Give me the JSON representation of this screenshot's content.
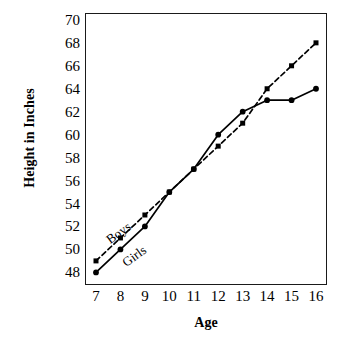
{
  "chart_data": {
    "type": "line",
    "title": "",
    "xlabel": "Age",
    "ylabel": "Height in Inches",
    "x": [
      7,
      8,
      9,
      10,
      11,
      12,
      13,
      14,
      15,
      16
    ],
    "xticklabels": [
      "7",
      "8",
      "9",
      "10",
      "11",
      "12",
      "13",
      "14",
      "15",
      "16"
    ],
    "yticklabels": [
      "70",
      "68",
      "66",
      "64",
      "62",
      "60",
      "58",
      "56",
      "54",
      "52",
      "50",
      "48"
    ],
    "yticks": [
      70,
      68,
      66,
      64,
      62,
      60,
      58,
      56,
      54,
      52,
      50,
      48
    ],
    "xlim": [
      6.55,
      16.45
    ],
    "ylim": [
      46.9,
      70.6
    ],
    "grid": false,
    "legend_position": "inline-annotations",
    "series": [
      {
        "name": "Boys",
        "style": "dashed",
        "marker": "square",
        "color": "#000000",
        "values": [
          49,
          51,
          53,
          55,
          57,
          59,
          61,
          64,
          66,
          68
        ]
      },
      {
        "name": "Girls",
        "style": "solid",
        "marker": "circle",
        "color": "#000000",
        "values": [
          48,
          50,
          52,
          55,
          57,
          60,
          62,
          63,
          63,
          64
        ]
      }
    ],
    "annotations": [
      {
        "text": "Boys",
        "rotation": -36
      },
      {
        "text": "Girls",
        "rotation": -36
      }
    ]
  }
}
